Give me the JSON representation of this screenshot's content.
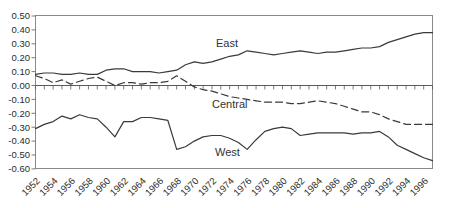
{
  "colors": {
    "background": "#ffffff",
    "line": "#3a3a3a",
    "axis": "#8a8a8a",
    "tick": "#5a5a5a",
    "text": "#2b2b2b"
  },
  "chart_data": {
    "type": "line",
    "title": "",
    "xlabel": "",
    "ylabel": "",
    "grid": false,
    "legend_position": "inline-labels",
    "ylim": [
      -0.6,
      0.5
    ],
    "ytick_step": 0.1,
    "ytick_labels": [
      "0.50",
      "0.40",
      "0.30",
      "0.20",
      "0.10",
      "0.00",
      "-0.10",
      "-0.20",
      "-0.30",
      "-0.40",
      "-0.50",
      "-0.60"
    ],
    "xtick_labels": [
      "1952",
      "1954",
      "1956",
      "1958",
      "1960",
      "1962",
      "1964",
      "1966",
      "1968",
      "1970",
      "1972",
      "1974",
      "1976",
      "1978",
      "1980",
      "1982",
      "1984",
      "1986",
      "1988",
      "1990",
      "1992",
      "1994",
      "1996"
    ],
    "x": [
      1952,
      1953,
      1954,
      1955,
      1956,
      1957,
      1958,
      1959,
      1960,
      1961,
      1962,
      1963,
      1964,
      1965,
      1966,
      1967,
      1968,
      1969,
      1970,
      1971,
      1972,
      1973,
      1974,
      1975,
      1976,
      1977,
      1978,
      1979,
      1980,
      1981,
      1982,
      1983,
      1984,
      1985,
      1986,
      1987,
      1988,
      1989,
      1990,
      1991,
      1992,
      1993,
      1994,
      1995,
      1996,
      1997
    ],
    "series": [
      {
        "name": "East",
        "line_style": "solid",
        "values": [
          0.08,
          0.09,
          0.09,
          0.08,
          0.08,
          0.09,
          0.08,
          0.08,
          0.11,
          0.12,
          0.12,
          0.1,
          0.1,
          0.1,
          0.09,
          0.1,
          0.11,
          0.15,
          0.17,
          0.16,
          0.17,
          0.19,
          0.21,
          0.22,
          0.25,
          0.24,
          0.23,
          0.22,
          0.23,
          0.24,
          0.25,
          0.24,
          0.23,
          0.24,
          0.24,
          0.25,
          0.26,
          0.27,
          0.27,
          0.28,
          0.31,
          0.33,
          0.35,
          0.37,
          0.38,
          0.38
        ]
      },
      {
        "name": "Central",
        "line_style": "dashed",
        "values": [
          0.07,
          0.05,
          0.02,
          0.04,
          0.01,
          0.03,
          0.05,
          0.06,
          0.03,
          0.0,
          0.02,
          0.02,
          0.01,
          0.02,
          0.02,
          0.03,
          0.07,
          0.03,
          -0.01,
          -0.03,
          -0.04,
          -0.06,
          -0.08,
          -0.09,
          -0.1,
          -0.11,
          -0.12,
          -0.12,
          -0.12,
          -0.13,
          -0.13,
          -0.12,
          -0.11,
          -0.12,
          -0.13,
          -0.15,
          -0.17,
          -0.19,
          -0.19,
          -0.21,
          -0.24,
          -0.26,
          -0.28,
          -0.28,
          -0.28,
          -0.28
        ]
      },
      {
        "name": "West",
        "line_style": "solid",
        "values": [
          -0.31,
          -0.28,
          -0.26,
          -0.22,
          -0.24,
          -0.21,
          -0.23,
          -0.24,
          -0.3,
          -0.37,
          -0.26,
          -0.26,
          -0.23,
          -0.23,
          -0.24,
          -0.25,
          -0.46,
          -0.44,
          -0.4,
          -0.37,
          -0.36,
          -0.36,
          -0.38,
          -0.41,
          -0.46,
          -0.39,
          -0.33,
          -0.31,
          -0.3,
          -0.31,
          -0.36,
          -0.35,
          -0.34,
          -0.34,
          -0.34,
          -0.34,
          -0.35,
          -0.34,
          -0.34,
          -0.33,
          -0.37,
          -0.43,
          -0.46,
          -0.49,
          -0.52,
          -0.54
        ]
      }
    ]
  }
}
